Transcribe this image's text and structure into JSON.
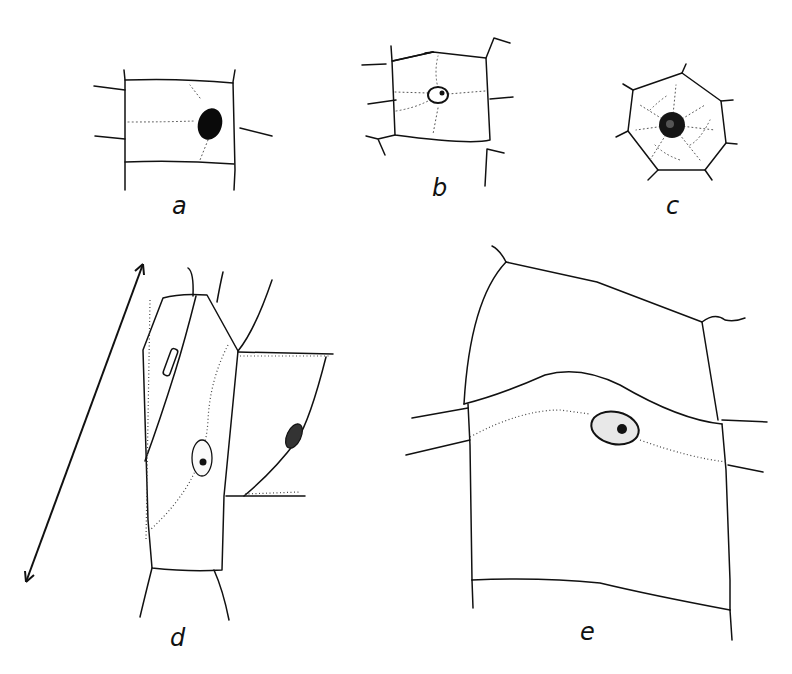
{
  "figure": {
    "panels": [
      {
        "id": "a",
        "label": "a",
        "content": "rectangular cell with dark nucleus right of center"
      },
      {
        "id": "b",
        "label": "b",
        "content": "quadrilateral cell with small central nucleus and radiating cytoplasmic strands"
      },
      {
        "id": "c",
        "label": "c",
        "content": "heptagonal cell with dark central nucleus and reticulate cytoplasm"
      },
      {
        "id": "d",
        "label": "d",
        "content": "elongated cells with nuclei along oblique walls, double-headed arrow indicating axis"
      },
      {
        "id": "e",
        "label": "e",
        "content": "large cell with spindle-shaped nucleus in a cytoplasmic band"
      }
    ],
    "annotations": {
      "arrow": "double-headed arrow (axis direction)"
    },
    "colors": {
      "ink": "#111111",
      "background": "#ffffff"
    }
  }
}
